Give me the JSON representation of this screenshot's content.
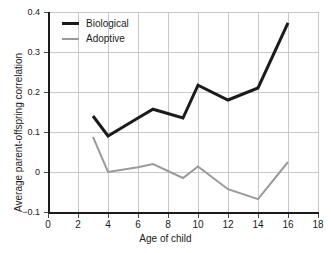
{
  "chart_data": {
    "type": "line",
    "title": "",
    "xlabel": "Age of child",
    "ylabel": "Average parent-offspring correlation",
    "xlim": [
      0,
      18
    ],
    "ylim": [
      -0.1,
      0.4
    ],
    "xticks": [
      "0",
      "2",
      "4",
      "6",
      "8",
      "10",
      "12",
      "14",
      "16",
      "18"
    ],
    "yticks": [
      "0.4",
      "0.3",
      "0.2",
      "0.1",
      "0",
      "−0.1"
    ],
    "xtick_values": [
      0,
      2,
      4,
      6,
      8,
      10,
      12,
      14,
      16,
      18
    ],
    "ytick_values": [
      0.4,
      0.3,
      0.2,
      0.1,
      0,
      -0.1
    ],
    "grid": true,
    "legend_position": "top-left",
    "x": [
      3,
      4,
      6,
      7,
      9,
      10,
      12,
      14,
      16
    ],
    "series": [
      {
        "name": "Biological",
        "color": "#1b1b1b",
        "width": 3,
        "values": [
          0.14,
          0.09,
          0.135,
          0.157,
          0.135,
          0.217,
          0.18,
          0.21,
          0.373
        ]
      },
      {
        "name": "Adoptive",
        "color": "#9a9a9a",
        "width": 2,
        "values": [
          0.088,
          0.0,
          0.012,
          0.02,
          -0.015,
          0.014,
          -0.043,
          -0.068,
          0.025
        ]
      }
    ]
  },
  "legend": {
    "items": [
      {
        "label": "Biological"
      },
      {
        "label": "Adoptive"
      }
    ]
  },
  "colors": {
    "biological": "#1b1b1b",
    "adoptive": "#9a9a9a",
    "grid": "#c9c9c9",
    "axis": "#1b1b1b",
    "background": "#ffffff"
  }
}
